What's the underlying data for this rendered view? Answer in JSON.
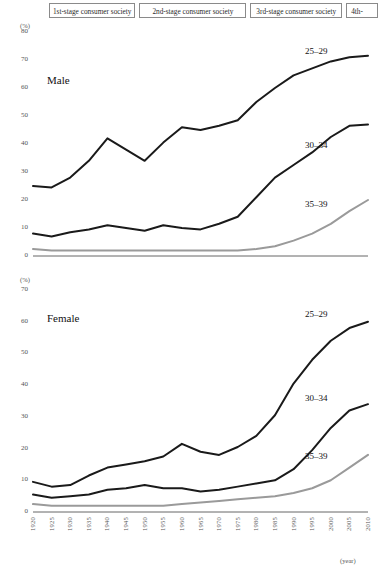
{
  "stages": {
    "items": [
      {
        "id": "stage-1",
        "label": "1st-stage consumer society"
      },
      {
        "id": "stage-2",
        "label": "2nd-stage consumer society"
      },
      {
        "id": "stage-3",
        "label": "3rd-stage consumer society"
      },
      {
        "id": "stage-4",
        "label": "4th-"
      }
    ]
  },
  "axis_units": {
    "percent": "(%)",
    "year": "(year)"
  },
  "panels": {
    "male": {
      "title": "Male",
      "yticks": [
        "80",
        "70",
        "60",
        "50",
        "40",
        "30",
        "20",
        "10",
        "0"
      ],
      "series_labels": {
        "a2529": "25–29",
        "a3034": "30–34",
        "a3539": "35–39"
      }
    },
    "female": {
      "title": "Female",
      "yticks": [
        "70",
        "60",
        "50",
        "40",
        "30",
        "20",
        "10",
        "0"
      ],
      "series_labels": {
        "a2529": "25–29",
        "a3034": "30–34",
        "a3539": "35–39"
      }
    }
  },
  "xticks": [
    "1920",
    "1925",
    "1930",
    "1935",
    "1940",
    "1945",
    "1950",
    "1955",
    "1960",
    "1965",
    "1970",
    "1975",
    "1980",
    "1985",
    "1990",
    "1995",
    "2000",
    "2005",
    "2010"
  ],
  "colors": {
    "line_dark": "#1a1a1a",
    "line_gray": "#9a9a9a",
    "axis": "#555555",
    "box_border": "#8a8a8a"
  },
  "chart_data": [
    {
      "type": "line",
      "title": "Male",
      "xlabel": "(year)",
      "ylabel": "(%)",
      "xlim": [
        1920,
        2010
      ],
      "ylim": [
        0,
        80
      ],
      "grid": false,
      "legend": "inline-right",
      "x": [
        1920,
        1925,
        1930,
        1935,
        1940,
        1945,
        1950,
        1955,
        1960,
        1965,
        1970,
        1975,
        1980,
        1985,
        1990,
        1995,
        2000,
        2005,
        2010
      ],
      "series": [
        {
          "name": "25–29",
          "color": "#1a1a1a",
          "values": [
            25,
            24.5,
            28,
            34,
            42,
            38,
            34,
            40.5,
            46,
            45,
            46.5,
            48.5,
            55,
            60,
            64.5,
            67,
            69.5,
            71,
            71.5
          ]
        },
        {
          "name": "30–34",
          "color": "#1a1a1a",
          "values": [
            8,
            7,
            8.5,
            9.5,
            11,
            10,
            9,
            11,
            10,
            9.5,
            11.5,
            14,
            21,
            28,
            32.5,
            37,
            42.5,
            46.5,
            47
          ]
        },
        {
          "name": "35–39",
          "color": "#9a9a9a",
          "values": [
            2.5,
            2,
            2,
            2,
            2,
            2,
            2,
            2,
            2,
            2,
            2,
            2,
            2.5,
            3.5,
            5.5,
            8,
            11.5,
            16,
            20
          ]
        }
      ]
    },
    {
      "type": "line",
      "title": "Female",
      "xlabel": "(year)",
      "ylabel": "(%)",
      "xlim": [
        1920,
        2010
      ],
      "ylim": [
        0,
        70
      ],
      "grid": false,
      "legend": "inline-right",
      "x": [
        1920,
        1925,
        1930,
        1935,
        1940,
        1945,
        1950,
        1955,
        1960,
        1965,
        1970,
        1975,
        1980,
        1985,
        1990,
        1995,
        2000,
        2005,
        2010
      ],
      "series": [
        {
          "name": "25–29",
          "color": "#1a1a1a",
          "values": [
            9.5,
            8,
            8.5,
            11.5,
            14,
            15,
            16,
            17.5,
            21.5,
            19,
            18,
            20.5,
            24,
            30.5,
            40.5,
            48,
            54,
            58,
            60
          ]
        },
        {
          "name": "30–34",
          "color": "#1a1a1a",
          "values": [
            5.5,
            4.5,
            5,
            5.5,
            7,
            7.5,
            8.5,
            7.5,
            7.5,
            6.5,
            7,
            8,
            9,
            10,
            13.5,
            19.5,
            26.5,
            32,
            34
          ]
        },
        {
          "name": "35–39",
          "color": "#9a9a9a",
          "values": [
            2.5,
            2,
            2,
            2,
            2,
            2,
            2,
            2,
            2.5,
            3,
            3.5,
            4,
            4.5,
            5,
            6,
            7.5,
            10,
            14,
            18
          ]
        }
      ]
    }
  ]
}
